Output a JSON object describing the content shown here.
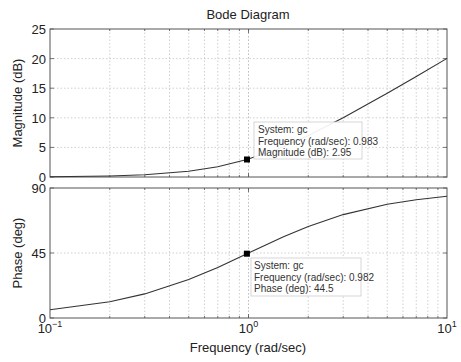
{
  "title": "Bode Diagram",
  "xlabel": "Frequency (rad/sec)",
  "x_ticks": [
    {
      "base": "10",
      "exp": "−1"
    },
    {
      "base": "10",
      "exp": "0"
    },
    {
      "base": "10",
      "exp": "1"
    }
  ],
  "magnitude": {
    "ylabel": "Magnitude (dB)",
    "y_ticks": [
      "0",
      "5",
      "10",
      "15",
      "20",
      "25"
    ],
    "datatip": {
      "line1": "System: gc",
      "line2": "Frequency (rad/sec): 0.983",
      "line3": "Magnitude (dB): 2.95"
    }
  },
  "phase": {
    "ylabel": "Phase (deg)",
    "y_ticks": [
      "0",
      "45",
      "90"
    ],
    "datatip": {
      "line1": "System: gc",
      "line2": "Frequency (rad/sec): 0.982",
      "line3": "Phase (deg): 44.5"
    }
  },
  "colors": {
    "curve": "#333333",
    "axis": "#555555",
    "grid": "#bbbbbb",
    "marker": "#000000",
    "tip_border": "#cccccc"
  },
  "chart_data": [
    {
      "type": "line",
      "title": "Bode Diagram",
      "subplot": "magnitude",
      "xlabel": "Frequency (rad/sec)",
      "ylabel": "Magnitude (dB)",
      "xscale": "log",
      "xlim": [
        0.1,
        10
      ],
      "ylim": [
        0,
        25
      ],
      "grid": true,
      "series": [
        {
          "name": "gc",
          "x": [
            0.1,
            0.2,
            0.3,
            0.5,
            0.7,
            0.983,
            1.5,
            2,
            3,
            5,
            7,
            10
          ],
          "y": [
            0.04,
            0.17,
            0.37,
            0.97,
            1.74,
            2.95,
            5.1,
            6.99,
            10.0,
            14.15,
            17.0,
            20.04
          ]
        }
      ],
      "annotations": [
        {
          "x": 0.983,
          "y": 2.95,
          "text": "System: gc / Frequency (rad/sec): 0.983 / Magnitude (dB): 2.95"
        }
      ]
    },
    {
      "type": "line",
      "subplot": "phase",
      "xlabel": "Frequency (rad/sec)",
      "ylabel": "Phase (deg)",
      "xscale": "log",
      "xlim": [
        0.1,
        10
      ],
      "ylim": [
        0,
        90
      ],
      "grid": true,
      "series": [
        {
          "name": "gc",
          "x": [
            0.1,
            0.2,
            0.3,
            0.5,
            0.7,
            0.982,
            1.5,
            2,
            3,
            5,
            7,
            10
          ],
          "y": [
            5.7,
            11.3,
            16.7,
            26.6,
            35.0,
            44.5,
            56.3,
            63.4,
            71.6,
            78.7,
            81.9,
            84.3
          ]
        }
      ],
      "annotations": [
        {
          "x": 0.982,
          "y": 44.5,
          "text": "System: gc / Frequency (rad/sec): 0.982 / Phase (deg): 44.5"
        }
      ]
    }
  ]
}
